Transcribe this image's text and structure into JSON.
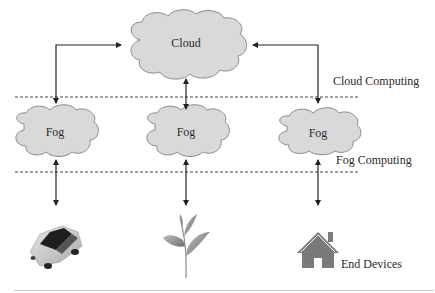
{
  "diagram": {
    "type": "fog-computing-architecture",
    "layers": [
      {
        "id": "cloud",
        "label": "Cloud Computing"
      },
      {
        "id": "fog",
        "label": "Fog Computing"
      },
      {
        "id": "edge",
        "label": "End Devices"
      }
    ],
    "cloud_node": {
      "label": "Cloud"
    },
    "fog_nodes": [
      {
        "label": "Fog"
      },
      {
        "label": "Fog"
      },
      {
        "label": "Fog"
      }
    ],
    "end_devices": [
      {
        "icon": "car-icon",
        "name": "Vehicle"
      },
      {
        "icon": "plant-icon",
        "name": "Plant"
      },
      {
        "icon": "house-icon",
        "name": "Home"
      }
    ],
    "colors": {
      "cloud_fill": "#d9d9d9",
      "cloud_stroke": "#8a8a8a",
      "arrow": "#222222",
      "dashed_line": "#444444",
      "icon_gray": "#7a7a7a"
    }
  }
}
